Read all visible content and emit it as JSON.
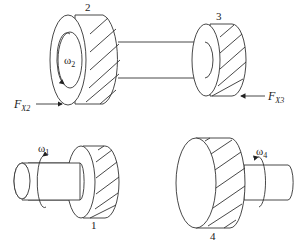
{
  "figure": {
    "gears": [
      {
        "id": "1",
        "label": "1",
        "omega": "ω",
        "omega_sub": "1"
      },
      {
        "id": "2",
        "label": "2",
        "omega": "ω",
        "omega_sub": "2"
      },
      {
        "id": "3",
        "label": "3"
      },
      {
        "id": "4",
        "label": "4",
        "omega": "ω",
        "omega_sub": "4"
      }
    ],
    "forces": [
      {
        "id": "FX2",
        "symbol": "F",
        "sub": "X2"
      },
      {
        "id": "FX3",
        "symbol": "F",
        "sub": "X3"
      }
    ]
  }
}
